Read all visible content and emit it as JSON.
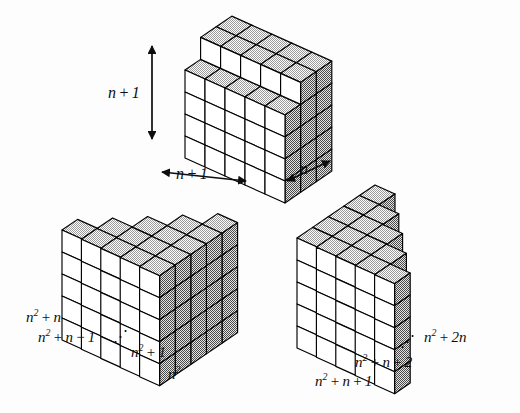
{
  "figure": {
    "background_color": "#fdfdfd",
    "ink_color": "#0d0d0d"
  },
  "palette": {
    "front_face": "#ffffff",
    "top_face": "#d8d8d8",
    "side_face": "#a8a8a8",
    "outline": "#000000"
  },
  "top_block": {
    "name": "main-box",
    "height_label_html": "<i>n</i>&#8201;<span class='op'>+</span>&#8201;1",
    "width_label_html": "<i>n</i>&#8201;<span class='op'>+</span>&#8201;1",
    "depth_label_html": "<i>n</i>",
    "dimensions": {
      "height": "n+1",
      "width": "n+1",
      "depth": "n"
    },
    "grid": {
      "cols": 5,
      "rows": 4,
      "depth_cells": 3
    }
  },
  "left_group": {
    "name": "descending-staircase",
    "slab_count": 5,
    "slab_height": 5,
    "labels": [
      {
        "id": "l1",
        "html": "<i>n</i><sup>2</sup>&#8201;<span class='op'>+</span>&#8201;<i>n</i>",
        "text": "n^2 + n"
      },
      {
        "id": "l2",
        "html": "<i>n</i><sup>2</sup>&#8201;<span class='op'>+</span>&#8201;<i>n</i>&#8201;<span class='op'>&#8722;</span>&#8201;1",
        "text": "n^2 + n - 1"
      },
      {
        "id": "l3",
        "html": "<span class='ell'>&#8944;</span>",
        "text": "..."
      },
      {
        "id": "l4",
        "html": "<i>n</i><sup>2</sup>&#8201;<span class='op'>+</span>&#8201;1",
        "text": "n^2 + 1"
      },
      {
        "id": "l5",
        "html": "<i>n</i><sup>2</sup>",
        "text": "n^2"
      }
    ]
  },
  "right_group": {
    "name": "ascending-staircase",
    "slab_count": 5,
    "slab_height": 5,
    "labels": [
      {
        "id": "r1",
        "html": "<i>n</i><sup>2</sup>&#8201;<span class='op'>+</span>&#8201;<i>n</i>&#8201;<span class='op'>+</span>&#8201;1",
        "text": "n^2 + n + 1"
      },
      {
        "id": "r2",
        "html": "<i>n</i><sup>2</sup>&#8201;<span class='op'>+</span>&#8201;<i>n</i>&#8201;<span class='op'>+</span>&#8201;2",
        "text": "n^2 + n + 2"
      },
      {
        "id": "r3",
        "html": "<span class='ell'>&#8944;</span>",
        "text": "..."
      },
      {
        "id": "r4",
        "html": "<i>n</i><sup>2</sup>&#8201;<span class='op'>+</span>&#8201;2<i>n</i>",
        "text": "n^2 + 2n"
      }
    ]
  }
}
